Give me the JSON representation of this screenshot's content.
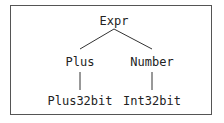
{
  "diagram": {
    "type": "tree",
    "root": {
      "label": "Expr"
    },
    "level1": [
      {
        "label": "Plus"
      },
      {
        "label": "Number"
      }
    ],
    "level2": [
      {
        "label": "Plus32bit",
        "parent": "Plus"
      },
      {
        "label": "Int32bit",
        "parent": "Number"
      }
    ],
    "edges": [
      [
        "Expr",
        "Plus"
      ],
      [
        "Expr",
        "Number"
      ],
      [
        "Plus",
        "Plus32bit"
      ],
      [
        "Number",
        "Int32bit"
      ]
    ]
  }
}
